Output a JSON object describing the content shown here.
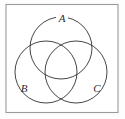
{
  "figure": {
    "kind": "venn-diagram",
    "title": "",
    "frame": {
      "visible": true,
      "color": "#9a9a9a"
    },
    "stroke_color": "#3b3b3b",
    "background_color": "#ffffff",
    "sets": [
      {
        "id": "A",
        "label": "A",
        "position": "top",
        "cx": 61,
        "cy": 48,
        "r": 31,
        "label_x": 62,
        "label_y": 19
      },
      {
        "id": "B",
        "label": "B",
        "position": "bottom-left",
        "cx": 46,
        "cy": 72,
        "r": 31,
        "label_x": 24,
        "label_y": 89
      },
      {
        "id": "C",
        "label": "C",
        "position": "bottom-right",
        "cx": 76,
        "cy": 72,
        "r": 31,
        "label_x": 97,
        "label_y": 89
      }
    ]
  }
}
